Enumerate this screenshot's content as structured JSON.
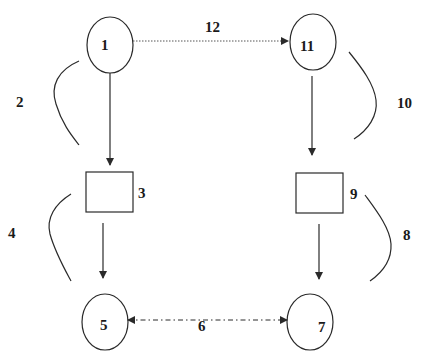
{
  "diagram": {
    "stroke_color": "#2a2a2a",
    "background": "#ffffff",
    "nodes": [
      {
        "id": "1",
        "label": "1",
        "shape": "ellipse"
      },
      {
        "id": "11",
        "label": "11",
        "shape": "ellipse"
      },
      {
        "id": "3",
        "label": "3",
        "shape": "rectangle"
      },
      {
        "id": "9",
        "label": "9",
        "shape": "rectangle"
      },
      {
        "id": "5",
        "label": "5",
        "shape": "ellipse"
      },
      {
        "id": "7",
        "label": "7",
        "shape": "ellipse"
      }
    ],
    "edges": [
      {
        "from": "1",
        "to": "11",
        "label": "12",
        "style": "dotted",
        "direction": "forward"
      },
      {
        "from": "1",
        "to": "3",
        "label": "",
        "style": "solid",
        "direction": "forward"
      },
      {
        "from": "3",
        "to": "5",
        "label": "",
        "style": "solid",
        "direction": "forward"
      },
      {
        "from": "11",
        "to": "9",
        "label": "",
        "style": "solid",
        "direction": "forward"
      },
      {
        "from": "9",
        "to": "7",
        "label": "",
        "style": "solid",
        "direction": "forward"
      },
      {
        "from": "5",
        "to": "7",
        "label": "6",
        "style": "dash-dot",
        "direction": "both"
      }
    ],
    "brackets": [
      {
        "spans": "1 to 3",
        "label": "2"
      },
      {
        "spans": "3 to 5",
        "label": "4"
      },
      {
        "spans": "11 to 9",
        "label": "10"
      },
      {
        "spans": "9 to 7",
        "label": "8"
      }
    ]
  }
}
